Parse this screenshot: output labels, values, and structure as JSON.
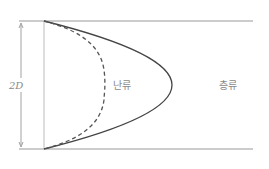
{
  "diagram": {
    "pipe_diameter_label": "2D",
    "profiles": [
      {
        "id": "turbulent",
        "label": "난류",
        "style": "dashed"
      },
      {
        "id": "laminar",
        "label": "층류",
        "style": "solid"
      }
    ],
    "colors": {
      "wall": "#9a9a9a",
      "laminar": "#444444",
      "turbulent": "#555555",
      "dimension": "#8a8a8a",
      "text": "#8a8a8a"
    }
  }
}
